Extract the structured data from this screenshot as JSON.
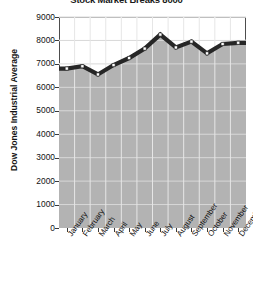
{
  "chart_data": {
    "type": "area",
    "title": "Stock Market Breaks 8000",
    "xlabel": "",
    "ylabel": "Dow Jones Industrial Average",
    "ylim": [
      0,
      9000
    ],
    "ytick_step": 1000,
    "yticks": [
      "0",
      "1000",
      "2000",
      "3000",
      "4000",
      "5000",
      "6000",
      "7000",
      "8000",
      "9000"
    ],
    "grid": true,
    "legend": "none",
    "colors": {
      "area_fill": "#b3b3b3",
      "line": "#262626",
      "marker_fill": "#ffffff",
      "marker_edge": "#1a1a1a",
      "gridline": "#ffffff",
      "axis": "#4d4d4d",
      "plot_background": "#ffffff",
      "text": "#111111"
    },
    "categories": [
      "January",
      "February",
      "March",
      "April",
      "May",
      "June",
      "July",
      "August",
      "September",
      "October",
      "November",
      "December*"
    ],
    "values": [
      6800,
      6900,
      6550,
      6950,
      7250,
      7650,
      8250,
      7700,
      7950,
      7450,
      7850,
      7900
    ],
    "series": [
      {
        "name": "Dow Jones Industrial Average",
        "values": [
          6800,
          6900,
          6550,
          6950,
          7250,
          7650,
          8250,
          7700,
          7950,
          7450,
          7850,
          7900
        ]
      }
    ],
    "footnote_marker": "*"
  }
}
